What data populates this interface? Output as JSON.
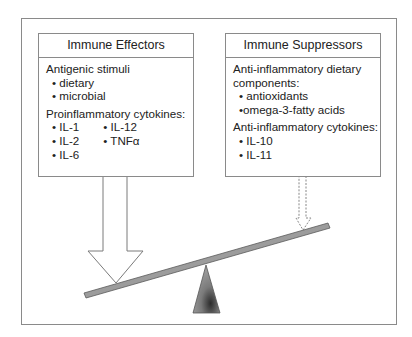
{
  "diagram": {
    "type": "balance-scale",
    "left_box": {
      "title": "Immune Effectors",
      "groups": [
        {
          "heading": "Antigenic stimuli",
          "items": [
            "• dietary",
            "• microbial"
          ]
        },
        {
          "heading": "Proinflammatory cytokines:",
          "columns": [
            [
              "• IL-1",
              "• IL-2",
              "• IL-6"
            ],
            [
              "• IL-12",
              "• TNFα"
            ]
          ]
        }
      ]
    },
    "right_box": {
      "title": "Immune Suppressors",
      "groups": [
        {
          "heading": "Anti-inflammatory dietary components:",
          "heading_lines": [
            "Anti-inflammatory dietary",
            "components:"
          ],
          "items": [
            "• antioxidants",
            "•omega-3-fatty acids"
          ]
        },
        {
          "heading": "Anti-inflammatory cytokines:",
          "items": [
            "• IL-10",
            "• IL-11"
          ]
        }
      ]
    },
    "arrows": [
      {
        "from": "left_box",
        "style": "solid-large",
        "meaning": "strong effect"
      },
      {
        "from": "right_box",
        "style": "dashed-small",
        "meaning": "weak effect"
      }
    ],
    "scale": {
      "tilt": "left side down",
      "beam_color": "#9a9a9a",
      "fulcrum_color": "#8c8c8c"
    }
  }
}
